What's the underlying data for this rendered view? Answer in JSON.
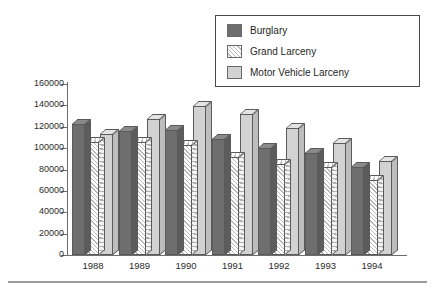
{
  "chart_data": {
    "type": "bar",
    "title": "",
    "subtitle": "",
    "xlabel": "",
    "ylabel": "",
    "categories": [
      "1988",
      "1989",
      "1990",
      "1991",
      "1992",
      "1993",
      "1994"
    ],
    "series": [
      {
        "name": "Burglary",
        "color": "#6e6e6e",
        "fill": "solid-dark",
        "values": [
          123000,
          116000,
          117000,
          109000,
          100000,
          95000,
          82000
        ]
      },
      {
        "name": "Grand Larceny",
        "color": "#f2f2f2",
        "fill": "diagonal-hatch",
        "values": [
          106000,
          106000,
          103000,
          92000,
          85000,
          82000,
          70000
        ]
      },
      {
        "name": "Motor Vehicle Larceny",
        "color": "#d2d2d2",
        "fill": "solid-light",
        "values": [
          113000,
          127000,
          139000,
          132000,
          119000,
          105000,
          88000
        ]
      }
    ],
    "ylim": [
      0,
      160000
    ],
    "ytick_values": [
      0,
      20000,
      40000,
      60000,
      80000,
      100000,
      120000,
      140000,
      160000
    ],
    "ytick_labels": [
      "0",
      "20000",
      "40000",
      "60000",
      "80000",
      "100000",
      "120000",
      "140000",
      "160000"
    ],
    "grid": false,
    "legend_position": "top-right",
    "style": "3d-columns"
  },
  "legend": {
    "items": [
      {
        "label": "Burglary",
        "swatch": "legend-swatch-burglary"
      },
      {
        "label": "Grand Larceny",
        "swatch": "legend-swatch-grand-larceny"
      },
      {
        "label": "Motor Vehicle Larceny",
        "swatch": "legend-swatch-motor-vehicle-larceny"
      }
    ]
  }
}
